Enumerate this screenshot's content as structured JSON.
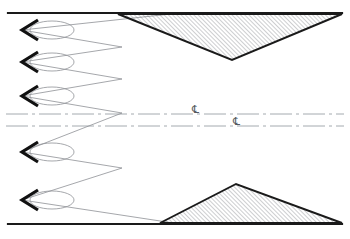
{
  "drawing": {
    "title": "Serpentine beam path schematic",
    "canvas": {
      "width": 350,
      "height": 239,
      "background": "#ffffff"
    },
    "colors": {
      "border_line": "#1a1a1a",
      "thin_line": "#8e9096",
      "arrow_fill": "#111111",
      "hatch_line": "#6f7378",
      "triangle_edge": "#1a1a1a",
      "centerline": "#9aa0a6",
      "label_text": "#555a60"
    },
    "borders": {
      "top": {
        "y": 13,
        "x1": 8,
        "x2": 342,
        "thickness": 2.2,
        "label": "top-reference-edge"
      },
      "bottom": {
        "y": 224,
        "x1": 8,
        "x2": 342,
        "thickness": 2.2,
        "label": "bottom-reference-edge"
      }
    },
    "centerlines": [
      {
        "name": "upper-centerline",
        "y": 114,
        "x1": 6,
        "x2": 344,
        "dash_pattern": "22 4 3 4",
        "symbol": "℄",
        "symbol_fallback": "CL",
        "symbol_x": 192,
        "symbol_y": 113
      },
      {
        "name": "lower-centerline",
        "y": 126,
        "x1": 6,
        "x2": 344,
        "dash_pattern": "22 4 3 4",
        "symbol": "℄",
        "symbol_fallback": "CL",
        "symbol_x": 233,
        "symbol_y": 125
      }
    ],
    "zigzag": {
      "name": "serpentine-ray-path",
      "stroke_width": 0.8,
      "left_x": 22,
      "right_x": 122,
      "description": "Folded optical path reflecting between left arrow stations and right turning points",
      "points": "180,13 22,30 122,47 22,62 122,79 22,96 122,113 22,152 122,168 22,200 180,224"
    },
    "arrows": [
      {
        "name": "arrow-station-1",
        "x": 22,
        "y": 30
      },
      {
        "name": "arrow-station-2",
        "x": 22,
        "y": 62
      },
      {
        "name": "arrow-station-3",
        "x": 22,
        "y": 96
      },
      {
        "name": "arrow-station-4",
        "x": 22,
        "y": 152
      },
      {
        "name": "arrow-station-5",
        "x": 22,
        "y": 200
      }
    ],
    "loops": [
      {
        "name": "waist-ellipse-1",
        "cx": 52,
        "cy": 30,
        "rx": 22,
        "ry": 9
      },
      {
        "name": "waist-ellipse-2",
        "cx": 52,
        "cy": 62,
        "rx": 22,
        "ry": 9
      },
      {
        "name": "waist-ellipse-3",
        "cx": 52,
        "cy": 96,
        "rx": 22,
        "ry": 9
      },
      {
        "name": "waist-ellipse-4",
        "cx": 52,
        "cy": 152,
        "rx": 22,
        "ry": 9
      },
      {
        "name": "waist-ellipse-5",
        "cx": 52,
        "cy": 200,
        "rx": 22,
        "ry": 9
      }
    ],
    "triangles": [
      {
        "name": "upper-hatched-wedge",
        "points": "118,14 342,14 232,60",
        "hatched": true,
        "orientation": "apex-down"
      },
      {
        "name": "lower-hatched-wedge",
        "points": "160,223 342,223 236,184",
        "hatched": true,
        "orientation": "apex-up"
      }
    ],
    "hatch": {
      "angle_degrees": 45,
      "spacing": 3,
      "stroke_width": 0.7
    }
  }
}
